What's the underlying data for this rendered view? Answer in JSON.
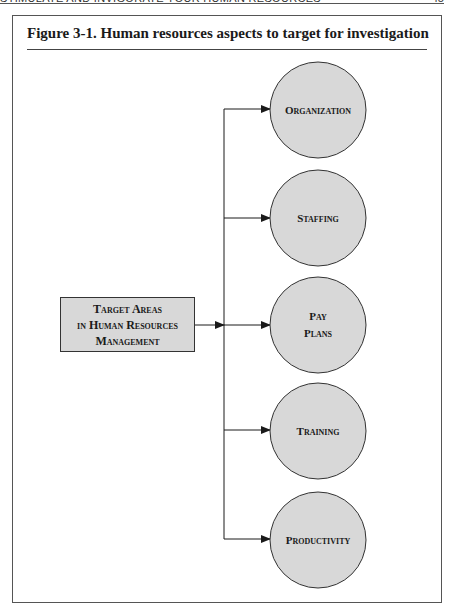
{
  "running_header": {
    "title": "STIMULATE AND INVIGORATE YOUR HUMAN RESOURCES",
    "page": "45"
  },
  "figure": {
    "title": "Figure 3-1.  Human resources aspects to target for investigation",
    "source": {
      "lines": [
        "Target Areas",
        "in Human Resources",
        "Management"
      ]
    },
    "targets": [
      {
        "label_lines": [
          "Organization"
        ]
      },
      {
        "label_lines": [
          "Staffing"
        ]
      },
      {
        "label_lines": [
          "Pay",
          "Plans"
        ]
      },
      {
        "label_lines": [
          "Training"
        ]
      },
      {
        "label_lines": [
          "Productivity"
        ]
      }
    ],
    "colors": {
      "fill": "#d8d8d8",
      "stroke": "#333333"
    }
  }
}
